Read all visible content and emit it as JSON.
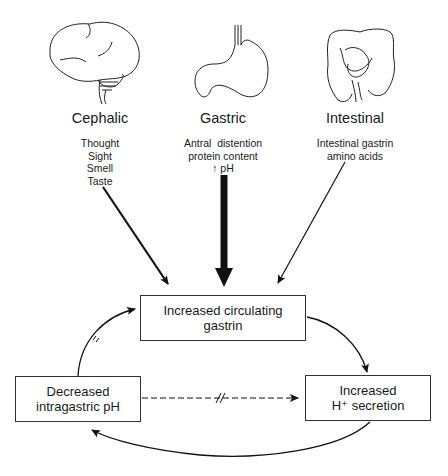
{
  "phases": [
    {
      "title": "Cephalic",
      "icon": "brain-icon",
      "stimuli": [
        "Thought",
        "Sight",
        "Smell",
        "Taste"
      ]
    },
    {
      "title": "Gastric",
      "icon": "stomach-icon",
      "stimuli": [
        "Antral  distention",
        "protein content",
        "↑ pH"
      ]
    },
    {
      "title": "Intestinal",
      "icon": "intestine-icon",
      "stimuli": [
        "Intestinal gastrin",
        "amino acids"
      ]
    }
  ],
  "boxes": {
    "gastrin": {
      "line1": "Increased circulating",
      "line2": "gastrin"
    },
    "ph": {
      "line1": "Decreased",
      "line2": "intragastric pH"
    },
    "secretion": {
      "line1": "Increased",
      "line2": "H⁺ secretion"
    }
  }
}
